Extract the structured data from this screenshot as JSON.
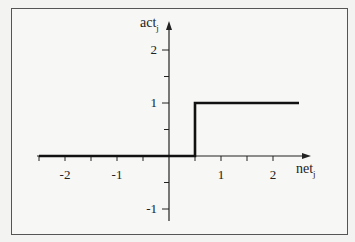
{
  "chart_data": {
    "type": "line",
    "title": "",
    "xlabel": "net",
    "xlabel_sub": "j",
    "ylabel": "act",
    "ylabel_sub": "j",
    "xlim": [
      -2.5,
      2.5
    ],
    "ylim": [
      -1.2,
      2.6
    ],
    "x_ticks": [
      -2,
      -1,
      1,
      2
    ],
    "x_tick_labels": [
      "-2",
      "-1",
      "1",
      "2"
    ],
    "x_minor_ticks": [
      -2.5,
      -2,
      -1.5,
      -1,
      -0.5,
      0.5,
      1,
      1.5,
      2
    ],
    "y_ticks": [
      2,
      1,
      -1
    ],
    "y_tick_labels": [
      "2",
      "1",
      "-1"
    ],
    "y_minor_ticks": [
      1.5,
      0.5,
      -0.5
    ],
    "grid": false,
    "legend": null,
    "series": [
      {
        "name": "step activation",
        "points": [
          [
            -2.5,
            0
          ],
          [
            0.5,
            0
          ],
          [
            0.5,
            1
          ],
          [
            2.5,
            1
          ]
        ],
        "threshold": 0.5,
        "low_value": 0,
        "high_value": 1
      }
    ]
  },
  "colors": {
    "line": "#111111",
    "axis": "#222222",
    "frame": "#555555",
    "background": "#f7f7f5"
  }
}
